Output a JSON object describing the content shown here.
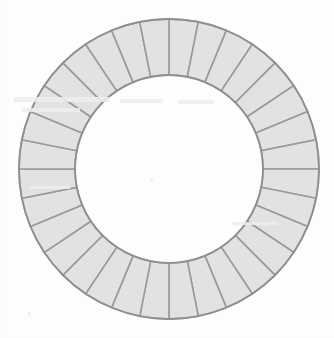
{
  "figure": {
    "background_color": "#fdfdfc"
  },
  "canvas": {
    "width": 334,
    "height": 338
  },
  "ring": {
    "center_x": 169,
    "center_y": 169,
    "outer_radius": 150,
    "inner_radius": 94,
    "segment_count": 32,
    "start_angle_deg": -90,
    "fill_color": "#e2e2e0",
    "stroke_color": "#9a9a99",
    "stroke_width": 1.6,
    "outline_color": "#8f8f8e",
    "outline_width": 1.8
  },
  "ghost_marks": [
    {
      "name": "faint-smudge-upper-left",
      "x": 14,
      "y": 97,
      "width": 96,
      "height": 5
    },
    {
      "name": "faint-smudge-upper-mid",
      "x": 120,
      "y": 99,
      "width": 42,
      "height": 4
    },
    {
      "name": "faint-smudge-upper-right",
      "x": 178,
      "y": 100,
      "width": 36,
      "height": 4
    },
    {
      "name": "faint-smudge-mid-left",
      "x": 22,
      "y": 108,
      "width": 58,
      "height": 4
    },
    {
      "name": "faint-smudge-lower-left",
      "x": 30,
      "y": 186,
      "width": 40,
      "height": 3
    },
    {
      "name": "faint-smudge-lower-right",
      "x": 232,
      "y": 222,
      "width": 46,
      "height": 3
    },
    {
      "name": "faint-speck-center",
      "x": 150,
      "y": 178,
      "width": 3,
      "height": 3
    },
    {
      "name": "faint-speck-bottom-left",
      "x": 28,
      "y": 312,
      "width": 3,
      "height": 4
    }
  ],
  "chart_data": {
    "type": "pie",
    "title": "",
    "categories": [
      "seg-01",
      "seg-02",
      "seg-03",
      "seg-04",
      "seg-05",
      "seg-06",
      "seg-07",
      "seg-08",
      "seg-09",
      "seg-10",
      "seg-11",
      "seg-12",
      "seg-13",
      "seg-14",
      "seg-15",
      "seg-16",
      "seg-17",
      "seg-18",
      "seg-19",
      "seg-20",
      "seg-21",
      "seg-22",
      "seg-23",
      "seg-24",
      "seg-25",
      "seg-26",
      "seg-27",
      "seg-28",
      "seg-29",
      "seg-30",
      "seg-31",
      "seg-32"
    ],
    "values": [
      11.25,
      11.25,
      11.25,
      11.25,
      11.25,
      11.25,
      11.25,
      11.25,
      11.25,
      11.25,
      11.25,
      11.25,
      11.25,
      11.25,
      11.25,
      11.25,
      11.25,
      11.25,
      11.25,
      11.25,
      11.25,
      11.25,
      11.25,
      11.25,
      11.25,
      11.25,
      11.25,
      11.25,
      11.25,
      11.25,
      11.25,
      11.25
    ],
    "unit": "degrees",
    "donut_hole_ratio": 0.627,
    "legend": "none",
    "grid": false
  }
}
